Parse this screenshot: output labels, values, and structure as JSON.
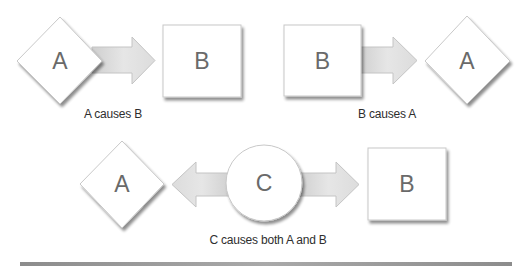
{
  "diagram": {
    "rows": [
      {
        "name": "a-causes-b",
        "source_label": "A",
        "target_label": "B",
        "caption": "A causes B"
      },
      {
        "name": "b-causes-a",
        "source_label": "B",
        "target_label": "A",
        "caption": "B causes A"
      },
      {
        "name": "c-causes-both",
        "left_label": "A",
        "center_label": "C",
        "right_label": "B",
        "caption": "C causes both A and B"
      }
    ],
    "colors": {
      "shape_fill": "#ffffff",
      "shape_stroke": "#c8c8c8",
      "shadow": "#9a9a9a",
      "arrow_fill": "#dedede",
      "arrow_stroke": "#c4c4c4",
      "label_text": "#6a6a6a",
      "caption_text": "#2e2e2e",
      "bottom_band": "#9a9a9a"
    }
  }
}
